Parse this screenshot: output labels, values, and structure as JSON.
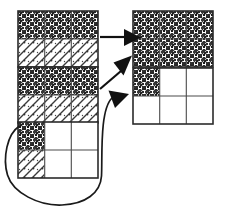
{
  "diagram": {
    "background_color": "#ffffff",
    "stroke_color": "#111111",
    "grid_border_color": "#2b2b2b",
    "cell_divider_color": "#4a4a4a",
    "fill_types": {
      "dark": "dense-dark-noise-texture",
      "light": "sparse-diagonal-hatch-texture",
      "empty": "white-blank"
    },
    "source_grids": [
      {
        "id": "source-grid-1",
        "label": "Top left grid",
        "columns": 3,
        "rows": 2,
        "x": 18,
        "y": 11,
        "width": 80,
        "height": 56,
        "cells": [
          [
            "dark",
            "dark",
            "dark"
          ],
          [
            "light",
            "light",
            "light"
          ]
        ]
      },
      {
        "id": "source-grid-2",
        "label": "Middle left grid",
        "columns": 3,
        "rows": 2,
        "x": 18,
        "y": 67,
        "width": 80,
        "height": 56,
        "cells": [
          [
            "dark",
            "dark",
            "dark"
          ],
          [
            "light",
            "light",
            "light"
          ]
        ]
      },
      {
        "id": "source-grid-3",
        "label": "Bottom left grid",
        "columns": 3,
        "rows": 2,
        "x": 18,
        "y": 122,
        "width": 80,
        "height": 56,
        "cells": [
          [
            "dark",
            "empty",
            "empty"
          ],
          [
            "light",
            "empty",
            "empty"
          ]
        ]
      }
    ],
    "target_grids": [
      {
        "id": "target-grid-1",
        "label": "Top right grid",
        "columns": 3,
        "rows": 2,
        "x": 133,
        "y": 11,
        "width": 80,
        "height": 56,
        "cells": [
          [
            "dark",
            "dark",
            "dark"
          ],
          [
            "dark",
            "dark",
            "dark"
          ]
        ]
      },
      {
        "id": "target-grid-2",
        "label": "Bottom right grid",
        "columns": 3,
        "rows": 2,
        "x": 133,
        "y": 68,
        "width": 80,
        "height": 56,
        "cells": [
          [
            "dark",
            "empty",
            "empty"
          ],
          [
            "empty",
            "empty",
            "empty"
          ]
        ]
      }
    ],
    "arrows": [
      {
        "id": "arrow-horizontal",
        "label": "Straight arrow from top left grid to top right grid",
        "style": "straight",
        "from": "source-grid-1",
        "to": "target-grid-1",
        "path": "M 100 37 L 124 37",
        "head_points": "124,29 141,37.5 124,46"
      },
      {
        "id": "arrow-diagonal",
        "label": "Diagonal arrow from middle left grid up to top right grid",
        "style": "straight-diagonal",
        "from": "source-grid-2",
        "to": "target-grid-1",
        "path": "M 100 88 L 120 70",
        "head_points": "114,63 132,56 124,75"
      },
      {
        "id": "arrow-curved",
        "label": "Curved arrow from bottom left grid around to bottom right grid",
        "style": "curved",
        "from": "source-grid-3",
        "to": "target-grid-2",
        "path": "M 19 126 C 6 135 2 160 8 176 C 14 193 40 206 62 205 C 85 204 100 193 101 176 C 102 158 100 110 113 98",
        "head_points": "110,90 128,95 115,108"
      }
    ]
  }
}
